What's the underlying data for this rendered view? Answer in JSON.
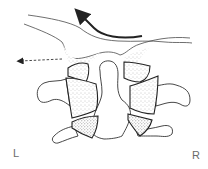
{
  "diagram": {
    "type": "anatomical-illustration",
    "labels": {
      "left": "L",
      "right": "R"
    },
    "arrows": [
      {
        "name": "curved-solid-arrow",
        "style": "solid",
        "direction": "up-left"
      },
      {
        "name": "dashed-arrow",
        "style": "dashed",
        "direction": "left"
      }
    ],
    "colors": {
      "line": "#3a3a3a",
      "arrow": "#222222",
      "stipple": "#9a9a9a",
      "background": "#ffffff"
    }
  }
}
